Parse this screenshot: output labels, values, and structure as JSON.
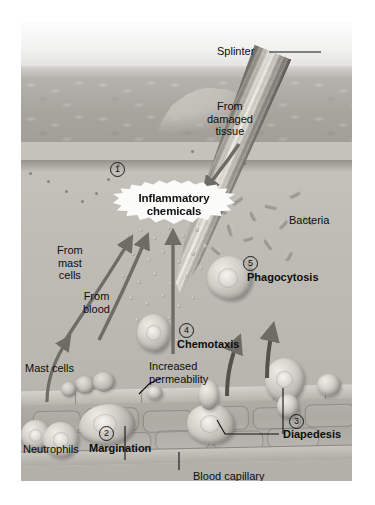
{
  "figure": {
    "labels": {
      "splinter": "Splinter",
      "from_damaged_tissue": "From\ndamaged\ntissue",
      "inflammatory_chemicals": "Inflammatory\nchemicals",
      "bacteria": "Bacteria",
      "from_mast_cells": "From\nmast\ncells",
      "from_blood": "From\nblood",
      "mast_cells": "Mast cells",
      "neutrophils": "Neutrophils",
      "increased_permeability": "Increased\npermeability",
      "phagocytosis": "Phagocytosis",
      "chemotaxis": "Chemotaxis",
      "margination": "Margination",
      "diapedesis": "Diapedesis",
      "blood_capillary": "Blood capillary\nor venule"
    },
    "step_numbers": {
      "one": "1",
      "two": "2",
      "three": "3",
      "four": "4",
      "five": "5"
    },
    "steps": [
      {
        "number": "1",
        "label": "Inflammatory chemicals"
      },
      {
        "number": "2",
        "label": "Margination"
      },
      {
        "number": "3",
        "label": "Diapedesis"
      },
      {
        "number": "4",
        "label": "Chemotaxis"
      },
      {
        "number": "5",
        "label": "Phagocytosis"
      }
    ],
    "colors": {
      "background": "#ffffff",
      "epidermis": "#a7a49e",
      "dermis": "#bfbcb6",
      "arrow": "#6f6c66",
      "text": "#0d0d0d",
      "burst_fill": "#fbfbfa"
    }
  }
}
